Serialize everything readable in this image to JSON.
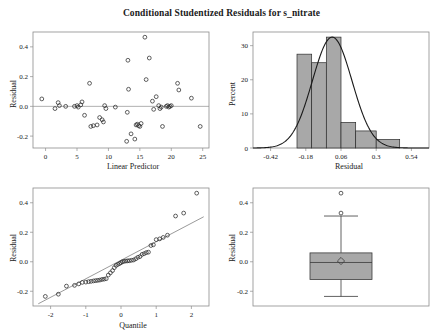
{
  "title": "Conditional Studentized Residuals for s_nitrate",
  "colors": {
    "bar_fill": "#a8a8a8",
    "marker_stroke": "#2b2b2b",
    "axis": "#8c8c8c",
    "curve": "#1a1a1a"
  },
  "panels": {
    "scatter": {
      "xlabel": "Linear Predictor",
      "ylabel": "Residual"
    },
    "histogram": {
      "xlabel": "Residual",
      "ylabel": "Percent"
    },
    "qq": {
      "xlabel": "Quantile",
      "ylabel": "Residual"
    },
    "box": {
      "xlabel": "",
      "ylabel": "Residual"
    }
  },
  "chart_data": [
    {
      "type": "scatter",
      "title": "Residual vs Linear Predictor",
      "xlabel": "Linear Predictor",
      "ylabel": "Residual",
      "xlim": [
        -2.0,
        26.0
      ],
      "ylim": [
        -0.28,
        0.5
      ],
      "xticks": [
        0,
        5,
        10,
        15,
        20,
        25
      ],
      "yticks": [
        -0.2,
        0.0,
        0.2,
        0.4
      ],
      "grid": false,
      "reference_line_y": 0.0,
      "x": [
        -0.6,
        1.5,
        2.0,
        2.2,
        3.2,
        4.6,
        5.0,
        5.2,
        5.6,
        5.8,
        6.2,
        7.0,
        7.2,
        7.6,
        8.2,
        8.6,
        9.0,
        9.2,
        9.4,
        9.6,
        11.1,
        12.9,
        13.0,
        13.1,
        13.2,
        13.6,
        14.2,
        14.4,
        14.6,
        14.8,
        15.0,
        15.2,
        15.8,
        16.0,
        16.5,
        17.0,
        17.2,
        17.6,
        18.0,
        18.2,
        18.4,
        18.6,
        19.2,
        19.4,
        19.6,
        19.8,
        20.0,
        21.0,
        21.2,
        23.2,
        24.6
      ],
      "y": [
        0.05,
        -0.015,
        0.025,
        0.005,
        0.0,
        0.0,
        0.005,
        -0.005,
        0.01,
        0.03,
        -0.06,
        0.155,
        -0.135,
        -0.13,
        -0.125,
        -0.075,
        -0.09,
        -0.105,
        0.005,
        -0.015,
        -0.005,
        -0.235,
        -0.04,
        0.31,
        0.115,
        -0.185,
        -0.22,
        -0.125,
        -0.12,
        -0.13,
        -0.135,
        -0.115,
        0.465,
        0.18,
        0.325,
        0.035,
        -0.02,
        0.065,
        0.005,
        -0.015,
        -0.005,
        -0.135,
        0.0,
        0.005,
        -0.005,
        0.0,
        0.005,
        0.155,
        0.11,
        0.055,
        -0.135
      ]
    },
    {
      "type": "bar",
      "title": "Histogram of Residuals with normal curve",
      "xlabel": "Residual",
      "ylabel": "Percent",
      "xlim": [
        -0.54,
        0.66
      ],
      "ylim": [
        0,
        34
      ],
      "xticks": [
        -0.42,
        -0.18,
        0.06,
        0.3,
        0.54
      ],
      "yticks": [
        0,
        10,
        20,
        30
      ],
      "bin_edges": [
        -0.24,
        -0.16,
        -0.08,
        0.0,
        0.08,
        0.16,
        0.24,
        0.32,
        0.4,
        0.48
      ],
      "bin_starts": [
        -0.24,
        -0.14,
        -0.04,
        0.06,
        0.16,
        0.3
      ],
      "bin_ends": [
        -0.14,
        -0.04,
        0.06,
        0.16,
        0.3,
        0.46
      ],
      "values": [
        27.5,
        25.0,
        32.5,
        7.5,
        5.0,
        2.5
      ],
      "normal_curve": {
        "mean": 0.0,
        "sd": 0.135,
        "peak_percent": 32.5
      }
    },
    {
      "type": "scatter",
      "title": "Q-Q plot of Residuals",
      "xlabel": "Quantile",
      "ylabel": "Residual",
      "xlim": [
        -2.5,
        2.5
      ],
      "ylim": [
        -0.3,
        0.5
      ],
      "xticks": [
        -2,
        -1,
        0,
        1,
        2
      ],
      "yticks": [
        -0.2,
        0.0,
        0.2,
        0.4
      ],
      "reference_line": {
        "x1": -2.35,
        "y1": -0.285,
        "x2": 2.35,
        "y2": 0.305
      },
      "x": [
        -2.15,
        -1.78,
        -1.55,
        -1.32,
        -1.2,
        -1.1,
        -1.0,
        -0.92,
        -0.85,
        -0.78,
        -0.72,
        -0.66,
        -0.6,
        -0.54,
        -0.48,
        -0.42,
        -0.36,
        -0.3,
        -0.24,
        -0.19,
        -0.14,
        -0.09,
        -0.04,
        0.0,
        0.04,
        0.09,
        0.14,
        0.19,
        0.24,
        0.3,
        0.36,
        0.42,
        0.48,
        0.54,
        0.6,
        0.66,
        0.72,
        0.78,
        0.85,
        0.92,
        1.0,
        1.1,
        1.2,
        1.32,
        1.55,
        1.78,
        2.15
      ],
      "y": [
        -0.235,
        -0.22,
        -0.165,
        -0.16,
        -0.15,
        -0.14,
        -0.138,
        -0.135,
        -0.133,
        -0.13,
        -0.128,
        -0.126,
        -0.124,
        -0.12,
        -0.118,
        -0.115,
        -0.09,
        -0.075,
        -0.06,
        -0.04,
        -0.025,
        -0.018,
        -0.012,
        -0.006,
        0.0,
        0.003,
        0.005,
        0.006,
        0.007,
        0.01,
        0.012,
        0.02,
        0.03,
        0.035,
        0.05,
        0.055,
        0.062,
        0.065,
        0.11,
        0.115,
        0.15,
        0.155,
        0.165,
        0.18,
        0.31,
        0.33,
        0.465
      ]
    },
    {
      "type": "box",
      "title": "Boxplot of Residuals",
      "xlabel": "",
      "ylabel": "Residual",
      "ylim": [
        -0.3,
        0.5
      ],
      "yticks": [
        -0.2,
        0.0,
        0.2,
        0.4
      ],
      "q1": -0.12,
      "median": -0.005,
      "q3": 0.06,
      "mean": 0.005,
      "whisker_low": -0.235,
      "whisker_high": 0.31,
      "outliers": [
        0.465,
        0.33
      ]
    }
  ]
}
